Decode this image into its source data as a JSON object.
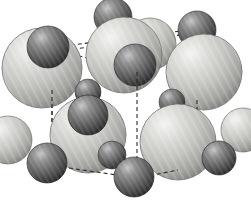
{
  "figure": {
    "background_color": "#ffffff",
    "width": 251,
    "height": 206
  },
  "palette": {
    "large_sphere_highlight": "#f2f2f0",
    "large_sphere_mid": "#c3c3c0",
    "large_sphere_edge": "#8e8e8b",
    "large_sphere_rim": "#6f6f6c",
    "small_sphere_highlight": "#bdbdbd",
    "small_sphere_mid": "#6e6e6e",
    "small_sphere_edge": "#3a3a3a",
    "small_sphere_rim": "#232323",
    "cell_edge_color": "#2b2b2b",
    "outline_color": "#5a5a58"
  },
  "cell": {
    "edge_style": "dashed",
    "dash_pattern": "4,3",
    "edge_width": 1.1,
    "vertices": {
      "top_back_left": [
        52,
        45
      ],
      "top_back_right": [
        197,
        30
      ],
      "top_front_left": [
        52,
        45
      ],
      "top_front_right": [
        137,
        72
      ],
      "bottom_back_left": [
        52,
        163
      ],
      "bottom_front_right": [
        137,
        178
      ],
      "right_mid_top": [
        197,
        100
      ],
      "right_mid_bottom": [
        197,
        122
      ]
    },
    "edges": [
      {
        "name": "top-left-to-top-right",
        "from": [
          57,
          47
        ],
        "to": [
          196,
          29
        ]
      },
      {
        "name": "top-left-to-front-center",
        "from": [
          59,
          50
        ],
        "to": [
          196,
          33
        ]
      },
      {
        "name": "top-left-to-center-front",
        "from": [
          58,
          50
        ],
        "to": [
          134,
          70
        ]
      },
      {
        "name": "left-vertical",
        "from": [
          52,
          48
        ],
        "to": [
          52,
          163
        ]
      },
      {
        "name": "center-vertical",
        "from": [
          137,
          72
        ],
        "to": [
          137,
          176
        ]
      },
      {
        "name": "right-vertical-upper",
        "from": [
          197,
          100
        ],
        "to": [
          197,
          122
        ]
      },
      {
        "name": "bottom-left-to-bottom-front",
        "from": [
          55,
          166
        ],
        "to": [
          131,
          177
        ]
      },
      {
        "name": "bottom-front-to-right",
        "from": [
          143,
          177
        ],
        "to": [
          176,
          171
        ]
      }
    ]
  },
  "spheres": {
    "large_label": "large anion sphere",
    "small_label": "small cation sphere",
    "large": [
      {
        "name": "large-sphere-top-left",
        "cx": 42,
        "cy": 68,
        "r": 40
      },
      {
        "name": "large-sphere-top-center",
        "cx": 124,
        "cy": 55,
        "r": 38
      },
      {
        "name": "large-sphere-top-right",
        "cx": 204,
        "cy": 72,
        "r": 38
      },
      {
        "name": "large-sphere-mid-left",
        "cx": 88,
        "cy": 135,
        "r": 38
      },
      {
        "name": "large-sphere-mid-right",
        "cx": 178,
        "cy": 142,
        "r": 38
      },
      {
        "name": "large-sphere-back-center",
        "cx": 150,
        "cy": 44,
        "r": 26
      },
      {
        "name": "large-sphere-left-edge",
        "cx": 8,
        "cy": 140,
        "r": 24
      },
      {
        "name": "large-sphere-right-edge",
        "cx": 243,
        "cy": 130,
        "r": 22
      }
    ],
    "small": [
      {
        "name": "small-sphere-top-left",
        "cx": 48,
        "cy": 47,
        "r": 21
      },
      {
        "name": "small-sphere-top-apex",
        "cx": 113,
        "cy": 17,
        "r": 19
      },
      {
        "name": "small-sphere-top-upper",
        "cx": 124,
        "cy": 38,
        "r": 20
      },
      {
        "name": "small-sphere-front-center",
        "cx": 135,
        "cy": 65,
        "r": 21
      },
      {
        "name": "small-sphere-top-right",
        "cx": 197,
        "cy": 30,
        "r": 19
      },
      {
        "name": "small-sphere-mid-left",
        "cx": 88,
        "cy": 115,
        "r": 20
      },
      {
        "name": "small-sphere-back-gap",
        "cx": 88,
        "cy": 92,
        "r": 13
      },
      {
        "name": "small-sphere-right-mid",
        "cx": 172,
        "cy": 102,
        "r": 13
      },
      {
        "name": "small-sphere-bottom-left",
        "cx": 47,
        "cy": 163,
        "r": 20
      },
      {
        "name": "small-sphere-bottom-front",
        "cx": 134,
        "cy": 177,
        "r": 20
      },
      {
        "name": "small-sphere-bottom-right",
        "cx": 219,
        "cy": 158,
        "r": 17
      },
      {
        "name": "small-sphere-bottom-mid",
        "cx": 112,
        "cy": 155,
        "r": 14
      }
    ]
  }
}
